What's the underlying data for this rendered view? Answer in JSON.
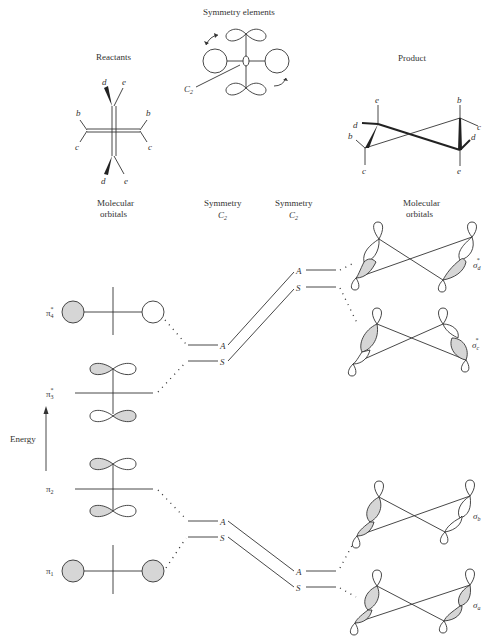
{
  "headings": {
    "reactants": "Reactants",
    "symmetry_elements": "Symmetry elements",
    "product": "Product",
    "left_mo": "Molecular",
    "left_mo2": "orbitals",
    "right_mo": "Molecular",
    "right_mo2": "orbitals",
    "sym_left": "Symmetry",
    "sym_left2": "C",
    "sym_left_sub": "2",
    "sym_right": "Symmetry",
    "sym_right2": "C",
    "sym_right_sub": "2"
  },
  "symmetry_label": {
    "main": "C",
    "sub": "2"
  },
  "reactant_labels": {
    "d_top": "d",
    "e_top": "e",
    "b_left": "b",
    "c_left": "c",
    "b_right": "b",
    "c_right": "c",
    "d_bottom": "d",
    "e_bottom": "e"
  },
  "product_labels": {
    "e1": "e",
    "d1": "d",
    "b1": "b",
    "c1": "c",
    "b2": "b",
    "c2": "c",
    "d2": "d",
    "e2": "e"
  },
  "energy_axis": {
    "label": "Energy"
  },
  "left_orbitals": [
    {
      "name": "π",
      "sub": "4",
      "sup": "*"
    },
    {
      "name": "π",
      "sub": "3",
      "sup": "*"
    },
    {
      "name": "π",
      "sub": "2",
      "sup": ""
    },
    {
      "name": "π",
      "sub": "1",
      "sup": ""
    }
  ],
  "left_levels": [
    {
      "upper": "A",
      "lower": "S"
    },
    {
      "upper": "A",
      "lower": "S"
    }
  ],
  "right_levels": [
    {
      "upper": "A",
      "lower": "S"
    },
    {
      "upper": "A",
      "lower": "S"
    }
  ],
  "right_orbitals": [
    {
      "name": "σ",
      "sub": "d",
      "sup": "*"
    },
    {
      "name": "σ",
      "sub": "c",
      "sup": "*"
    },
    {
      "name": "σ",
      "sub": "b",
      "sup": ""
    },
    {
      "name": "σ",
      "sub": "a",
      "sup": ""
    }
  ],
  "colors": {
    "ink": "#333333",
    "shade": "#d6d6d6",
    "background": "#ffffff"
  }
}
